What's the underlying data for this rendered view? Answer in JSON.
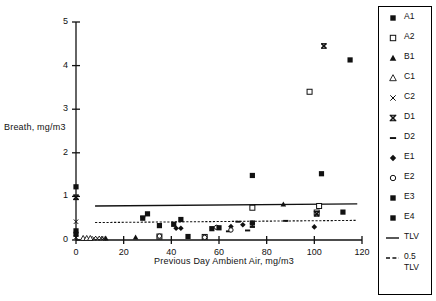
{
  "chart_data": {
    "type": "scatter",
    "title": "",
    "xlabel": "Previous Day Ambient Air, mg/m3",
    "ylabel": "Breath,  mg/m3",
    "xlim": [
      0,
      120
    ],
    "ylim": [
      0,
      5
    ],
    "xticks": [
      0,
      20,
      40,
      60,
      80,
      100,
      120
    ],
    "yticks": [
      0,
      1,
      2,
      3,
      4,
      5
    ],
    "grid": false,
    "legend_position": "right-outside",
    "series": [
      {
        "name": "A1",
        "marker": "filled-square",
        "points": [
          [
            0,
            1.22
          ],
          [
            0,
            0.21
          ],
          [
            0,
            0.13
          ],
          [
            28,
            0.5
          ],
          [
            30,
            0.6
          ],
          [
            35,
            0.33
          ],
          [
            41,
            0.36
          ],
          [
            44,
            0.47
          ],
          [
            47,
            0.08
          ],
          [
            57,
            0.26
          ],
          [
            74,
            1.48
          ],
          [
            103,
            1.52
          ],
          [
            115,
            4.13
          ],
          [
            112,
            0.64
          ]
        ]
      },
      {
        "name": "A2",
        "marker": "open-square",
        "points": [
          [
            35,
            0.08
          ],
          [
            54,
            0.07
          ],
          [
            74,
            0.74
          ],
          [
            98,
            3.4
          ],
          [
            102,
            0.78
          ],
          [
            101,
            0.63
          ]
        ]
      },
      {
        "name": "B1",
        "marker": "filled-triangle",
        "points": [
          [
            12.5,
            0.04
          ],
          [
            25,
            0.06
          ],
          [
            87,
            0.82
          ]
        ]
      },
      {
        "name": "C1",
        "marker": "open-triangle",
        "points": [
          [
            3,
            0.04
          ],
          [
            4.5,
            0.04
          ],
          [
            6,
            0.04
          ]
        ]
      },
      {
        "name": "C2",
        "marker": "cross-x",
        "points": [
          [
            0,
            0.42
          ],
          [
            0,
            0.06
          ],
          [
            7.5,
            0.04
          ],
          [
            9,
            0.04
          ],
          [
            10.5,
            0.04
          ],
          [
            11.5,
            0.04
          ]
        ]
      },
      {
        "name": "D1",
        "marker": "bold-x",
        "points": [
          [
            0,
            0.98
          ],
          [
            101,
            0.6
          ],
          [
            104,
            4.45
          ]
        ]
      },
      {
        "name": "D2",
        "marker": "dash",
        "points": [
          [
            28,
            0.54
          ],
          [
            64,
            0.2
          ],
          [
            72,
            0.22
          ],
          [
            74,
            0.3
          ],
          [
            88,
            0.44
          ],
          [
            68,
            0.42
          ]
        ]
      },
      {
        "name": "E1",
        "marker": "filled-diamond",
        "points": [
          [
            42,
            0.27
          ],
          [
            44,
            0.27
          ],
          [
            65,
            0.31
          ],
          [
            70,
            0.35
          ],
          [
            74,
            0.38
          ],
          [
            100,
            0.3
          ]
        ]
      },
      {
        "name": "E2",
        "marker": "open-circle",
        "points": [
          [
            35,
            0.09
          ],
          [
            54,
            0.06
          ],
          [
            59,
            0.29
          ],
          [
            65,
            0.23
          ]
        ]
      },
      {
        "name": "E3",
        "marker": "filled-square",
        "points": [
          [
            60,
            0.28
          ]
        ]
      },
      {
        "name": "E4",
        "marker": "filled-square",
        "points": [
          [
            74,
            0.39
          ]
        ]
      }
    ],
    "reference_lines": [
      {
        "name": "TLV",
        "style": "solid",
        "y_start": 0.78,
        "y_end": 0.83,
        "x_start": 8,
        "x_end": 118
      },
      {
        "name": "0.5 TLV",
        "style": "dashed",
        "y_start": 0.4,
        "y_end": 0.45,
        "x_start": 8,
        "x_end": 118
      }
    ]
  },
  "axes": {
    "y_label": "Breath,  mg/m3",
    "x_label": "Previous Day  Ambient Air,  mg/m3",
    "y_tick_labels": [
      "0",
      "1",
      "2",
      "3",
      "4",
      "5"
    ],
    "x_tick_labels": [
      "0",
      "20",
      "40",
      "60",
      "80",
      "100",
      "120"
    ]
  },
  "legend": {
    "items": [
      {
        "label": "A1",
        "marker": "filled-square"
      },
      {
        "label": "A2",
        "marker": "open-square"
      },
      {
        "label": "B1",
        "marker": "filled-triangle"
      },
      {
        "label": "C1",
        "marker": "open-triangle"
      },
      {
        "label": "C2",
        "marker": "cross-x"
      },
      {
        "label": "D1",
        "marker": "bold-x"
      },
      {
        "label": "D2",
        "marker": "dash"
      },
      {
        "label": "E1",
        "marker": "filled-diamond"
      },
      {
        "label": "E2",
        "marker": "open-circle"
      },
      {
        "label": "E3",
        "marker": "filled-square"
      },
      {
        "label": "E4",
        "marker": "filled-square"
      },
      {
        "label": "TLV",
        "marker": "solid-line"
      },
      {
        "label": "0.5\nTLV",
        "marker": "dashed-line"
      }
    ]
  },
  "colors": {
    "ink": "#111111",
    "background": "#ffffff"
  }
}
